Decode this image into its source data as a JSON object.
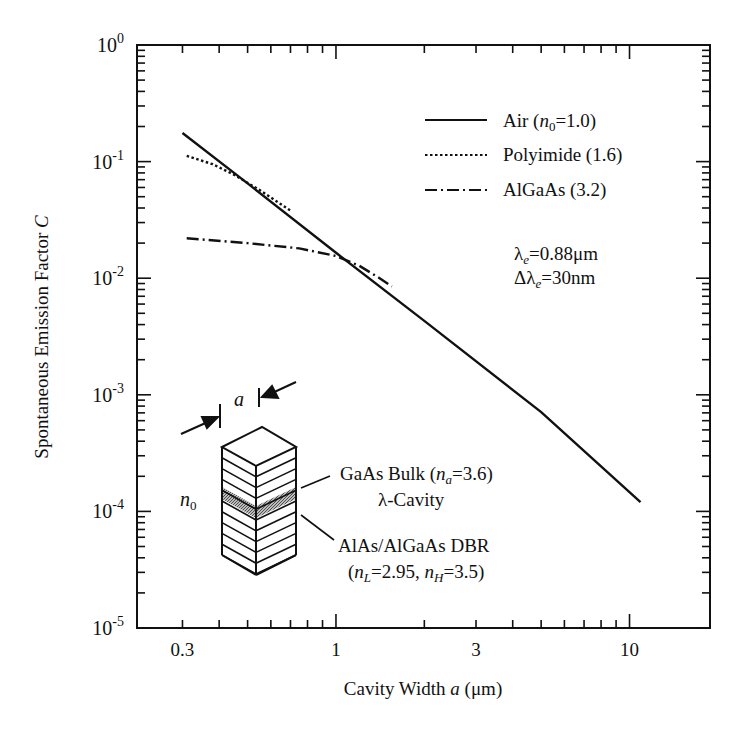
{
  "chart_data": {
    "type": "line",
    "title": "",
    "xlabel": "Cavity Width a (μm)",
    "ylabel": "Spontaneous Emission Factor C",
    "xscale": "log",
    "yscale": "log",
    "xlim": [
      0.21,
      18.8
    ],
    "ylim": [
      1e-05,
      1
    ],
    "x_ticks": [
      {
        "value": 0.3,
        "label": "0.3"
      },
      {
        "value": 1,
        "label": "1"
      },
      {
        "value": 3,
        "label": "3"
      },
      {
        "value": 10,
        "label": "10"
      }
    ],
    "y_ticks": [
      {
        "value": 1,
        "base": "10",
        "exp": "0"
      },
      {
        "value": 0.1,
        "base": "10",
        "exp": "-1"
      },
      {
        "value": 0.01,
        "base": "10",
        "exp": "-2"
      },
      {
        "value": 0.001,
        "base": "10",
        "exp": "-3"
      },
      {
        "value": 0.0001,
        "base": "10",
        "exp": "-4"
      },
      {
        "value": 1e-05,
        "base": "10",
        "exp": "-5"
      }
    ],
    "grid": false,
    "legend_position": "upper right",
    "series": [
      {
        "name": "Air (n0=1.0)",
        "style": "solid",
        "x": [
          0.3,
          0.5,
          1.0,
          2.0,
          5.0,
          10.9
        ],
        "y": [
          0.176,
          0.065,
          0.0165,
          0.0043,
          0.00071,
          0.00012
        ]
      },
      {
        "name": "Polyimide (1.6)",
        "style": "dotted",
        "x": [
          0.31,
          0.38,
          0.45,
          0.55,
          0.7
        ],
        "y": [
          0.112,
          0.095,
          0.077,
          0.057,
          0.038
        ]
      },
      {
        "name": "AlGaAs (3.2)",
        "style": "dash-dot",
        "x": [
          0.31,
          0.5,
          0.75,
          1.0,
          1.2,
          1.4,
          1.55
        ],
        "y": [
          0.022,
          0.02,
          0.018,
          0.0155,
          0.0128,
          0.0101,
          0.0085
        ]
      }
    ],
    "annotations": [
      "λe=0.88μm",
      "Δλe=30nm",
      "GaAs Bulk (na=3.6)",
      "λ-Cavity",
      "AlAs/AlGaAs DBR",
      "(nL=2.95, nH=3.5)",
      "a",
      "n0"
    ]
  },
  "axes": {
    "y_label_main": "Spontaneous Emission Factor ",
    "y_label_var": "C",
    "x_label_main": "Cavity Width ",
    "x_label_var": "a",
    "x_label_unit": " (μm)"
  },
  "legend": {
    "air": {
      "prefix": "Air (",
      "var": "n",
      "sub": "0",
      "suffix": "=1.0)"
    },
    "polyimide": {
      "label": "Polyimide (1.6)"
    },
    "algaas": {
      "label": "AlGaAs (3.2)"
    }
  },
  "params": {
    "lambda_sym": "λ",
    "lambda_sub": "e",
    "lambda_val": "=0.88μm",
    "dlambda_sym": "Δλ",
    "dlambda_sub": "e",
    "dlambda_val": "=30nm"
  },
  "inset": {
    "a_label": "a",
    "n0_var": "n",
    "n0_sub": "0",
    "gaas_prefix": "GaAs Bulk (",
    "gaas_var": "n",
    "gaas_sub": "a",
    "gaas_suffix": "=3.6)",
    "cavity": "λ-Cavity",
    "dbr": "AlAs/AlGaAs DBR",
    "dbr_open": "(",
    "nl_var": "n",
    "nl_sub": "L",
    "nl_val": "=2.95, ",
    "nh_var": "n",
    "nh_sub": "H",
    "nh_val": "=3.5)"
  }
}
